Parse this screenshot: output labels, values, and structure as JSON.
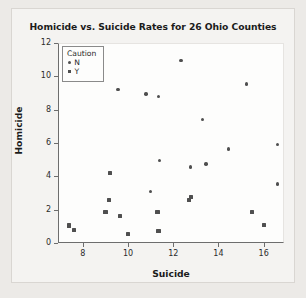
{
  "chart_data": {
    "type": "scatter",
    "title": "Homicide vs. Suicide Rates for 26 Ohio Counties",
    "xlabel": "Suicide",
    "ylabel": "Homicide",
    "xlim": [
      6.9,
      16.9
    ],
    "ylim": [
      0,
      12
    ],
    "xticks": [
      "8",
      "10",
      "12",
      "14",
      "16"
    ],
    "xtick_values": [
      8,
      10,
      12,
      14,
      16
    ],
    "yticks": [
      "0",
      "2",
      "4",
      "6",
      "8",
      "10",
      "12"
    ],
    "ytick_values": [
      0,
      2,
      4,
      6,
      8,
      10,
      12
    ],
    "grid": false,
    "legend": {
      "title": "Caution",
      "position": "top-left-inside",
      "entries": [
        {
          "label": "N",
          "marker": "circle"
        },
        {
          "label": "Y",
          "marker": "square"
        }
      ]
    },
    "series": [
      {
        "name": "N",
        "marker": "circle",
        "points": [
          {
            "x": 9.55,
            "y": 9.2
          },
          {
            "x": 10.8,
            "y": 8.95
          },
          {
            "x": 11.35,
            "y": 8.8
          },
          {
            "x": 12.35,
            "y": 10.95
          },
          {
            "x": 15.25,
            "y": 9.55
          },
          {
            "x": 13.3,
            "y": 7.4
          },
          {
            "x": 14.45,
            "y": 5.65
          },
          {
            "x": 16.6,
            "y": 5.9
          },
          {
            "x": 11.4,
            "y": 4.95
          },
          {
            "x": 12.75,
            "y": 4.55
          },
          {
            "x": 13.45,
            "y": 4.75
          },
          {
            "x": 16.6,
            "y": 3.55
          },
          {
            "x": 11.0,
            "y": 3.1
          }
        ]
      },
      {
        "name": "Y",
        "marker": "square",
        "points": [
          {
            "x": 7.4,
            "y": 1.05
          },
          {
            "x": 7.6,
            "y": 0.8
          },
          {
            "x": 9.0,
            "y": 1.85
          },
          {
            "x": 9.2,
            "y": 4.2
          },
          {
            "x": 9.15,
            "y": 2.6
          },
          {
            "x": 9.65,
            "y": 1.6
          },
          {
            "x": 10.0,
            "y": 0.55
          },
          {
            "x": 11.3,
            "y": 1.85
          },
          {
            "x": 11.35,
            "y": 0.7
          },
          {
            "x": 12.7,
            "y": 2.6
          },
          {
            "x": 12.8,
            "y": 2.75
          },
          {
            "x": 15.5,
            "y": 1.85
          },
          {
            "x": 16.0,
            "y": 1.1
          }
        ]
      }
    ]
  }
}
